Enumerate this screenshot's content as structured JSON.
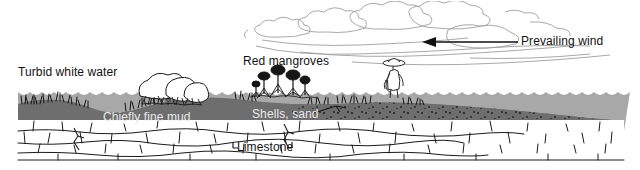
{
  "figure": {
    "type": "geological-cross-section",
    "title_visible": false,
    "width": 640,
    "height": 170
  },
  "colors": {
    "sky": "#ffffff",
    "water": "#a8a8a8",
    "mud": "#6e6e6e",
    "limestone_fill": "#ffffff",
    "limestone_outline": "#1a1a1a",
    "cloud_outline": "#9a9a9a",
    "text_dark": "#1a1a1a",
    "text_light": "#f0f0f0",
    "arrow": "#111111"
  },
  "labels": {
    "turbid_white_water": "Turbid white water",
    "red_mangroves": "Red mangroves",
    "prevailing_wind": "Prevailing wind",
    "chiefly_fine_mud": "Chiefly fine mud",
    "shells_sand": "Shells, sand",
    "limestone": "Limestone"
  },
  "annotations": {
    "wind_arrow_direction": "left",
    "shells_sand_leader": true
  },
  "layers": [
    {
      "name": "sky",
      "fill": "#ffffff"
    },
    {
      "name": "water",
      "fill": "#a8a8a8"
    },
    {
      "name": "mud",
      "fill": "#6e6e6e"
    },
    {
      "name": "limestone",
      "fill": "#ffffff"
    }
  ],
  "features": {
    "clouds": 4,
    "mangrove_clumps_left": 1,
    "mangrove_trees_center": 5,
    "wading_person": 1,
    "marsh_grass_tufts": "many"
  }
}
